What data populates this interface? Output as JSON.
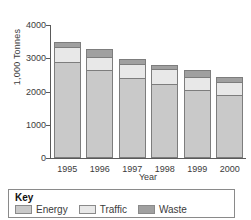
{
  "chart_data": {
    "type": "bar",
    "subtype": "stacked",
    "title": "",
    "xlabel": "Year",
    "ylabel": "1,000 Tonnes",
    "categories": [
      "1995",
      "1996",
      "1997",
      "1998",
      "1999",
      "2000"
    ],
    "ylim": [
      0,
      4000
    ],
    "yticks": [
      0,
      1000,
      2000,
      3000,
      4000
    ],
    "ytick_labels": [
      "0",
      "1000",
      "2000",
      "3000",
      "4000"
    ],
    "grid": false,
    "legend_position": "below",
    "legend_title": "Key",
    "series": [
      {
        "name": "Energy",
        "color": "#c9c9c9",
        "values": [
          2900,
          2650,
          2400,
          2220,
          2060,
          1910
        ]
      },
      {
        "name": "Traffic",
        "color": "#e8e8e8",
        "values": [
          450,
          400,
          430,
          450,
          380,
          390
        ]
      },
      {
        "name": "Waste",
        "color": "#a0a0a0",
        "values": [
          150,
          230,
          150,
          140,
          200,
          130
        ]
      }
    ],
    "totals": [
      3500,
      3280,
      2980,
      2810,
      2640,
      2430
    ]
  },
  "legend": {
    "title": "Key",
    "items": [
      {
        "label": "Energy",
        "color": "#c9c9c9"
      },
      {
        "label": "Traffic",
        "color": "#e8e8e8"
      },
      {
        "label": "Waste",
        "color": "#a0a0a0"
      }
    ]
  }
}
